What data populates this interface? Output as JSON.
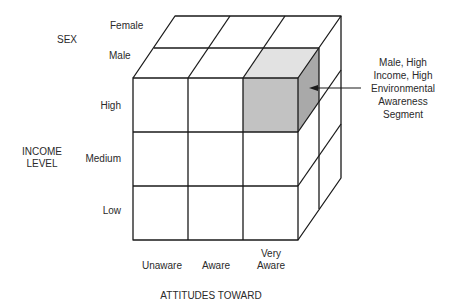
{
  "diagram": {
    "type": "segmentation-cube",
    "axes": {
      "sex": {
        "title": "SEX",
        "levels": [
          "Female",
          "Male"
        ]
      },
      "income": {
        "title_line1": "INCOME",
        "title_line2": "LEVEL",
        "levels": [
          "High",
          "Medium",
          "Low"
        ]
      },
      "attitudes": {
        "title": "ATTITUDES TOWARD",
        "levels": [
          "Unaware",
          "Aware",
          "Very Aware"
        ],
        "very_aware_line1": "Very",
        "very_aware_line2": "Aware"
      }
    },
    "highlight": {
      "segment": {
        "sex": "Male",
        "income": "High",
        "attitude": "Very Aware"
      },
      "callout_lines": [
        "Male, High",
        "Income, High",
        "Environmental",
        "Awareness",
        "Segment"
      ],
      "colors": {
        "front": "#c2c2c2",
        "top": "#e2e2e2",
        "side": "#a9a9a9"
      }
    }
  }
}
